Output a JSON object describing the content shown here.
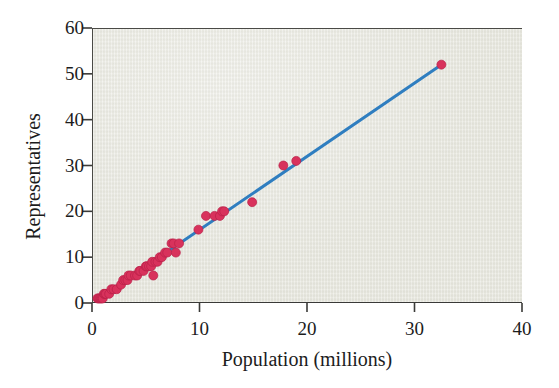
{
  "figure": {
    "width": 559,
    "height": 388,
    "background_color": "#ffffff",
    "plot_background_color": "#e9e9e1",
    "frame_color": "#4a4a46"
  },
  "chart_data": {
    "type": "scatter",
    "title": "",
    "xlabel": "Population (millions)",
    "ylabel": "Representatives",
    "xlim": [
      0,
      40
    ],
    "ylim": [
      0,
      60
    ],
    "xticks": [
      0,
      10,
      20,
      30,
      40
    ],
    "yticks": [
      0,
      10,
      20,
      30,
      40,
      50,
      60
    ],
    "xtick_labels": [
      "0",
      "10",
      "20",
      "30",
      "40"
    ],
    "ytick_labels": [
      "0",
      "10",
      "20",
      "30",
      "40",
      "50",
      "60"
    ],
    "grid": false,
    "legend": null,
    "marker": {
      "shape": "circle",
      "color": "#d8325c",
      "edge_color": "#b92048",
      "size_px": 9
    },
    "series": [
      {
        "name": "States",
        "type": "scatter",
        "points": [
          {
            "x": 0.5,
            "y": 1
          },
          {
            "x": 0.6,
            "y": 1
          },
          {
            "x": 0.7,
            "y": 1
          },
          {
            "x": 0.8,
            "y": 1
          },
          {
            "x": 0.9,
            "y": 1
          },
          {
            "x": 1.0,
            "y": 1
          },
          {
            "x": 1.1,
            "y": 2
          },
          {
            "x": 1.2,
            "y": 2
          },
          {
            "x": 1.3,
            "y": 2
          },
          {
            "x": 1.6,
            "y": 2
          },
          {
            "x": 1.8,
            "y": 3
          },
          {
            "x": 2.0,
            "y": 3
          },
          {
            "x": 2.3,
            "y": 3
          },
          {
            "x": 2.7,
            "y": 4
          },
          {
            "x": 2.9,
            "y": 5
          },
          {
            "x": 3.1,
            "y": 5
          },
          {
            "x": 3.3,
            "y": 5
          },
          {
            "x": 3.4,
            "y": 6
          },
          {
            "x": 3.6,
            "y": 6
          },
          {
            "x": 4.0,
            "y": 6
          },
          {
            "x": 4.2,
            "y": 6
          },
          {
            "x": 4.4,
            "y": 7
          },
          {
            "x": 4.5,
            "y": 7
          },
          {
            "x": 4.8,
            "y": 7
          },
          {
            "x": 5.0,
            "y": 8
          },
          {
            "x": 5.1,
            "y": 8
          },
          {
            "x": 5.3,
            "y": 8
          },
          {
            "x": 5.5,
            "y": 8
          },
          {
            "x": 5.6,
            "y": 9
          },
          {
            "x": 5.7,
            "y": 6
          },
          {
            "x": 5.9,
            "y": 9
          },
          {
            "x": 6.1,
            "y": 9
          },
          {
            "x": 6.3,
            "y": 10
          },
          {
            "x": 6.5,
            "y": 10
          },
          {
            "x": 6.8,
            "y": 11
          },
          {
            "x": 7.0,
            "y": 11
          },
          {
            "x": 7.4,
            "y": 13
          },
          {
            "x": 7.6,
            "y": 13
          },
          {
            "x": 7.8,
            "y": 11
          },
          {
            "x": 8.1,
            "y": 13
          },
          {
            "x": 9.9,
            "y": 16
          },
          {
            "x": 10.6,
            "y": 19
          },
          {
            "x": 11.4,
            "y": 19
          },
          {
            "x": 11.9,
            "y": 19
          },
          {
            "x": 12.1,
            "y": 20
          },
          {
            "x": 12.3,
            "y": 20
          },
          {
            "x": 14.9,
            "y": 22
          },
          {
            "x": 17.8,
            "y": 30
          },
          {
            "x": 19.0,
            "y": 31
          },
          {
            "x": 32.5,
            "y": 52
          }
        ]
      },
      {
        "name": "Regression line",
        "type": "line",
        "color": "#2f7ec0",
        "width_px": 3,
        "from": {
          "x": 0.4,
          "y": 0.6
        },
        "to": {
          "x": 32.5,
          "y": 52.0
        },
        "slope": 1.6,
        "intercept": 0.0
      }
    ]
  }
}
